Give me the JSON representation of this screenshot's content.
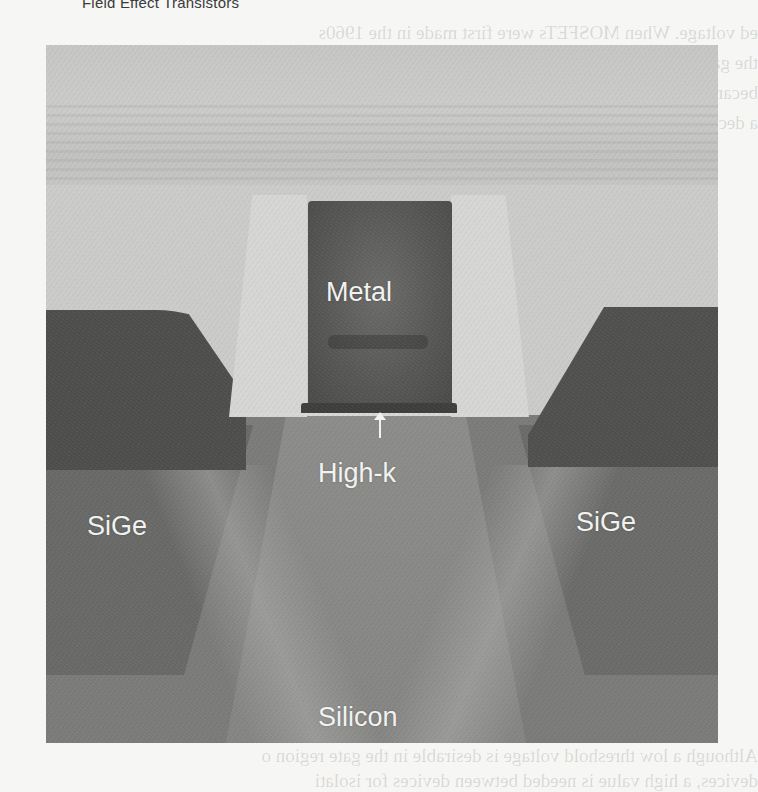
{
  "page": {
    "running_header": "Field Effect Transistors",
    "bleed_through_lines": [
      "ed voltage. When MOSFETs were first made in the 1960s",
      "the gate was made of aluminum and deposited",
      "became a technical challenge to build a h",
      "a decade later the gate material was Her",
      "polysilicon was used for the gate (f",
      "and uniformity were easier to produ",
      "the metal gate returned in MOSFE",
      "mechan",
      "posed",
      "functi",
      "atrac",
      "in id",
      "using",
      "ve(f",
      "legat",
      "ner",
      "lon",
      "ca",
      "een",
      "tells.",
      "Although a low threshold voltage is desirable in the gate region o",
      "devices, a high value is needed between devices for isolati"
    ]
  },
  "figure": {
    "type": "TEM cross-section micrograph of a high-k / metal-gate MOSFET",
    "labels": {
      "metal": "Metal",
      "high_k": "High-k",
      "sige_left": "SiGe",
      "sige_right": "SiGe",
      "silicon": "Silicon"
    },
    "arrow_target": "High-k dielectric layer under metal gate"
  }
}
